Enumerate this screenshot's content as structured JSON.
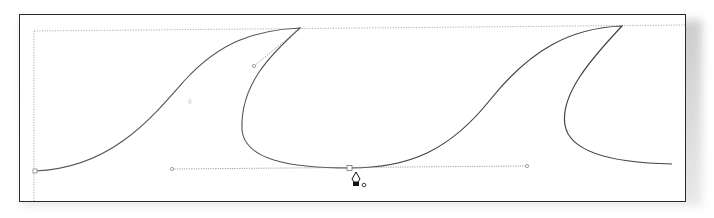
{
  "app": {
    "view": "vector illustration canvas",
    "tool": "pen-tool"
  },
  "canvas": {
    "artboard_label": "Artboard",
    "guide_color": "#9a9a9a",
    "stroke_color": "#555555",
    "paths": [
      {
        "name": "wave-1",
        "description": "first wave curve ending in a curl at top"
      },
      {
        "name": "wave-2",
        "description": "second wave curve with hooked crest"
      }
    ],
    "handles": [
      {
        "name": "direction-handle-left",
        "x": 172,
        "y": 168
      },
      {
        "name": "anchor-point-selected",
        "x": 350,
        "y": 168
      },
      {
        "name": "direction-handle-right",
        "x": 527,
        "y": 165
      }
    ],
    "cursor": {
      "name": "pen-cursor",
      "x": 356,
      "y": 180
    }
  }
}
